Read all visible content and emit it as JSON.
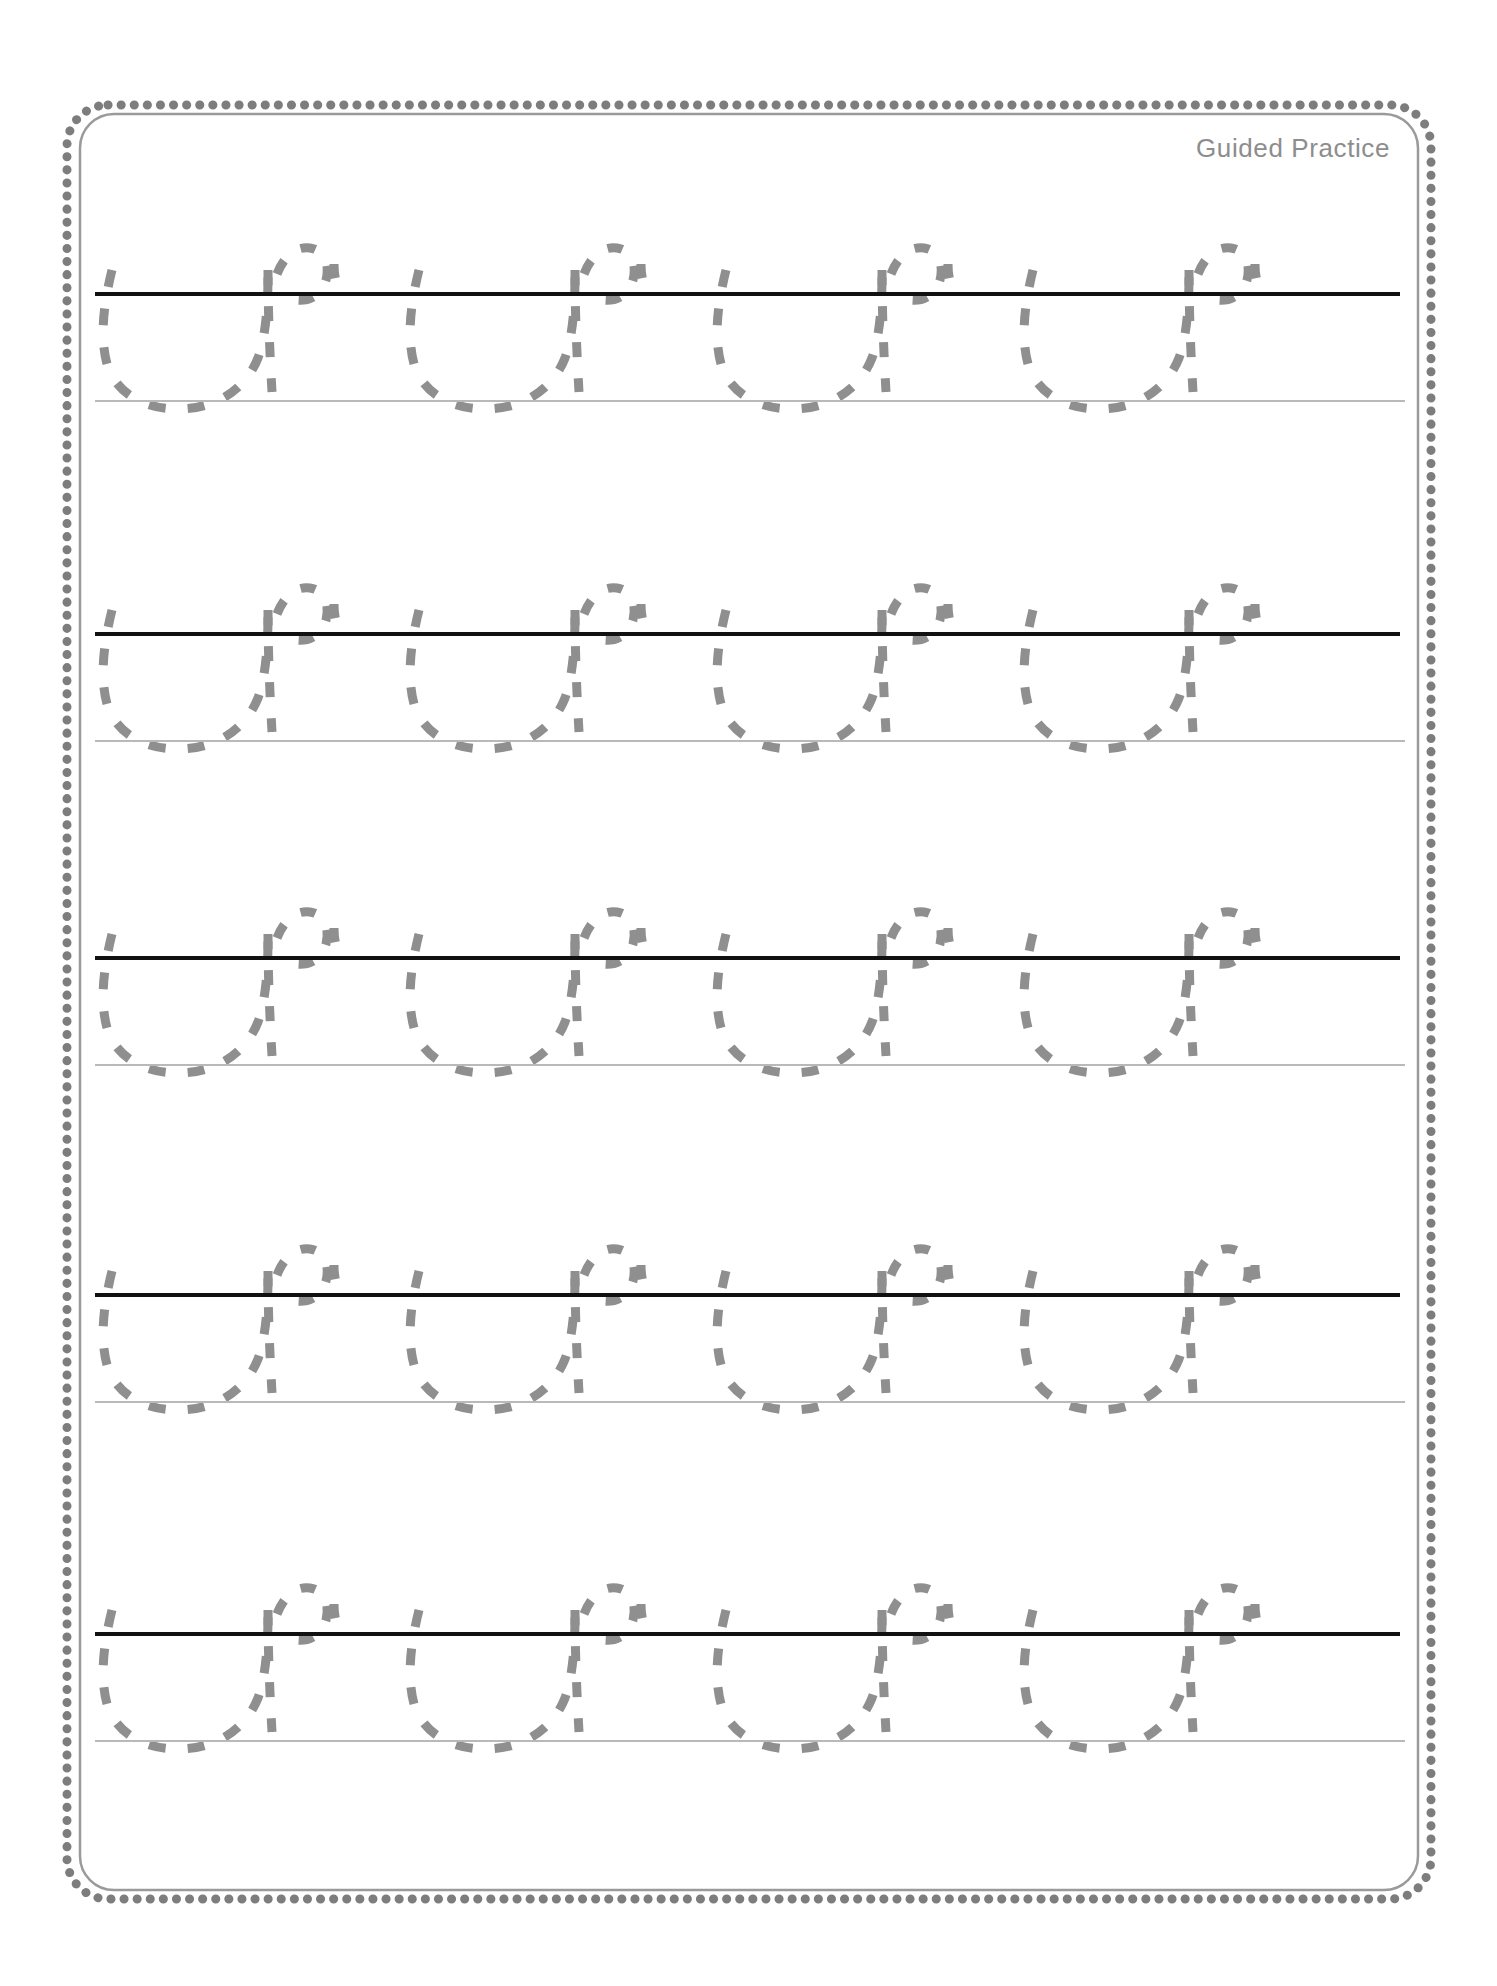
{
  "page": {
    "width": 1497,
    "height": 1986,
    "background_color": "#ffffff"
  },
  "border": {
    "style": "scalloped",
    "color": "#808080",
    "corner_radius": 44
  },
  "header": {
    "label": "Guided Practice",
    "color": "#8d8d8d",
    "align": "right"
  },
  "lines": {
    "midline_color": "#111111",
    "baseline_color": "#b9b9b9",
    "midline_left": 95,
    "midline_width": 1305
  },
  "tracing": {
    "letter": "u",
    "stroke_color": "#8f8f8f",
    "stroke_style": "dashed",
    "stroke_width": 9,
    "letters_per_row": 4,
    "row_count": 5
  },
  "rows": [
    {
      "index": 1,
      "top": 186,
      "midline_y": 106,
      "baseline_y": 214,
      "letters": [
        {
          "index": 1,
          "x": 100
        },
        {
          "index": 2,
          "x": 407
        },
        {
          "index": 3,
          "x": 714
        },
        {
          "index": 4,
          "x": 1021
        }
      ]
    },
    {
      "index": 2,
      "top": 526,
      "midline_y": 106,
      "baseline_y": 214,
      "letters": [
        {
          "index": 1,
          "x": 100
        },
        {
          "index": 2,
          "x": 407
        },
        {
          "index": 3,
          "x": 714
        },
        {
          "index": 4,
          "x": 1021
        }
      ]
    },
    {
      "index": 3,
      "top": 850,
      "midline_y": 106,
      "baseline_y": 214,
      "letters": [
        {
          "index": 1,
          "x": 100
        },
        {
          "index": 2,
          "x": 407
        },
        {
          "index": 3,
          "x": 714
        },
        {
          "index": 4,
          "x": 1021
        }
      ]
    },
    {
      "index": 4,
      "top": 1187,
      "midline_y": 106,
      "baseline_y": 214,
      "letters": [
        {
          "index": 1,
          "x": 100
        },
        {
          "index": 2,
          "x": 407
        },
        {
          "index": 3,
          "x": 714
        },
        {
          "index": 4,
          "x": 1021
        }
      ]
    },
    {
      "index": 5,
      "top": 1526,
      "midline_y": 106,
      "baseline_y": 214,
      "letters": [
        {
          "index": 1,
          "x": 100
        },
        {
          "index": 2,
          "x": 407
        },
        {
          "index": 3,
          "x": 714
        },
        {
          "index": 4,
          "x": 1021
        }
      ]
    }
  ]
}
